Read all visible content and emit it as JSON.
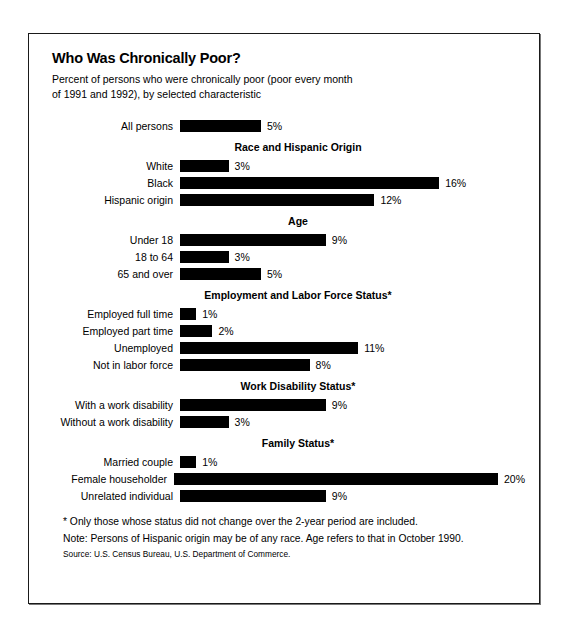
{
  "chart_data": {
    "type": "bar",
    "title": "Who Was Chronically Poor?",
    "subtitle_line1": "Percent of persons who were chronically poor (poor every month",
    "subtitle_line2": "of 1991 and 1992), by selected characteristic",
    "xlabel": "",
    "ylabel": "",
    "orientation": "horizontal",
    "grid": false,
    "legend": "none",
    "xlim": [
      0,
      20
    ],
    "value_suffix": "%",
    "bar_color": "#000000",
    "groups": [
      {
        "heading": "",
        "items": [
          {
            "label": "All persons",
            "value": 5,
            "value_label": "5%"
          }
        ]
      },
      {
        "heading": "Race and Hispanic Origin",
        "items": [
          {
            "label": "White",
            "value": 3,
            "value_label": "3%"
          },
          {
            "label": "Black",
            "value": 16,
            "value_label": "16%"
          },
          {
            "label": "Hispanic origin",
            "value": 12,
            "value_label": "12%"
          }
        ]
      },
      {
        "heading": "Age",
        "items": [
          {
            "label": "Under 18",
            "value": 9,
            "value_label": "9%"
          },
          {
            "label": "18 to 64",
            "value": 3,
            "value_label": "3%"
          },
          {
            "label": "65 and over",
            "value": 5,
            "value_label": "5%"
          }
        ]
      },
      {
        "heading": "Employment and Labor Force Status*",
        "items": [
          {
            "label": "Employed full time",
            "value": 1,
            "value_label": "1%"
          },
          {
            "label": "Employed part time",
            "value": 2,
            "value_label": "2%"
          },
          {
            "label": "Unemployed",
            "value": 11,
            "value_label": "11%"
          },
          {
            "label": "Not in labor force",
            "value": 8,
            "value_label": "8%"
          }
        ]
      },
      {
        "heading": "Work Disability Status*",
        "items": [
          {
            "label": "With a work disability",
            "value": 9,
            "value_label": "9%"
          },
          {
            "label": "Without a work disability",
            "value": 3,
            "value_label": "3%"
          }
        ]
      },
      {
        "heading": "Family Status*",
        "items": [
          {
            "label": "Married couple",
            "value": 1,
            "value_label": "1%"
          },
          {
            "label": "Female householder",
            "value": 20,
            "value_label": "20%"
          },
          {
            "label": "Unrelated individual",
            "value": 9,
            "value_label": "9%"
          }
        ]
      }
    ]
  },
  "notes": {
    "footnote": "* Only those whose status did not change over the 2-year period are included.",
    "note": "Note:  Persons of Hispanic origin may be of any race.  Age refers to that in October 1990.",
    "source": "Source:  U.S. Census Bureau, U.S. Department of Commerce."
  }
}
